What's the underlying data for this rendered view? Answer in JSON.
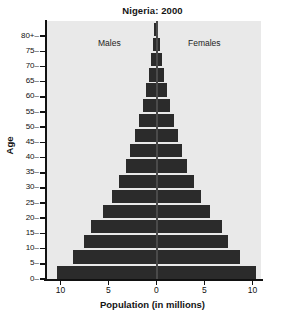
{
  "chart_data": {
    "type": "bar",
    "subtype": "population-pyramid",
    "title": "Nigeria: 2000",
    "xlabel": "Population (in millions)",
    "ylabel": "Age",
    "grid": false,
    "legend_position": "in-plot",
    "xlim": [
      -11.5,
      11.5
    ],
    "x_tick_values": [
      -10,
      -5,
      0,
      5,
      10
    ],
    "x_tick_labels": [
      "10",
      "5",
      "0",
      "5",
      "10"
    ],
    "y_tick_labels": [
      "0",
      "5",
      "10",
      "15",
      "20",
      "25",
      "30",
      "35",
      "40",
      "45",
      "50",
      "55",
      "60",
      "65",
      "70",
      "75",
      "80+"
    ],
    "categories": [
      "0-4",
      "5-9",
      "10-14",
      "15-19",
      "20-24",
      "25-29",
      "30-34",
      "35-39",
      "40-44",
      "45-49",
      "50-54",
      "55-59",
      "60-64",
      "65-69",
      "70-74",
      "75-79",
      "80+"
    ],
    "annotations": [
      {
        "text": "Males",
        "side": "left"
      },
      {
        "text": "Females",
        "side": "right"
      }
    ],
    "series": [
      {
        "name": "Males",
        "values": [
          10.4,
          8.7,
          7.5,
          6.8,
          5.6,
          4.6,
          3.9,
          3.2,
          2.7,
          2.2,
          1.8,
          1.4,
          1.1,
          0.8,
          0.55,
          0.35,
          0.2
        ]
      },
      {
        "name": "Females",
        "values": [
          10.4,
          8.7,
          7.5,
          6.8,
          5.6,
          4.6,
          3.9,
          3.2,
          2.7,
          2.2,
          1.8,
          1.4,
          1.1,
          0.8,
          0.55,
          0.35,
          0.2
        ]
      }
    ],
    "colors": {
      "bar": "#2b2b2b",
      "plot_background": "#e9e9e9",
      "figure_background": "#ffffff",
      "axis": "#111111",
      "center_line": "#4a4a4a",
      "text": "#141414"
    }
  }
}
